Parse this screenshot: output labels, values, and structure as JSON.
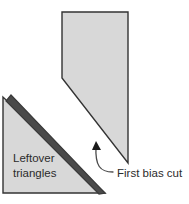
{
  "figure": {
    "background_color": "#ffffff",
    "fabric_fill": "#d8d8d8",
    "fabric_stroke": "#333333",
    "cut_edge_color": "#4a4a4a",
    "leader_color": "#4a4a4a",
    "text_color": "#2b2b2b"
  },
  "labels": {
    "leftover_line1": "Leftover",
    "leftover_line2": "triangles",
    "first_bias_cut": "First bias cut"
  },
  "shapes": {
    "main_piece": {
      "name": "main-fabric-piece",
      "points": "62,12 128,12 128,163 62,78"
    },
    "leftover_triangle": {
      "name": "leftover-triangle-piece",
      "points": "3,97 3,193 105,193"
    },
    "cut_band": {
      "name": "bias-cut-band",
      "points": "11,95 105,193 99,194 6,101"
    }
  },
  "leader": {
    "path": "M 113,172 C 100,172 95,166 96,146",
    "arrow_points": "96,141 101,150 92,150"
  }
}
